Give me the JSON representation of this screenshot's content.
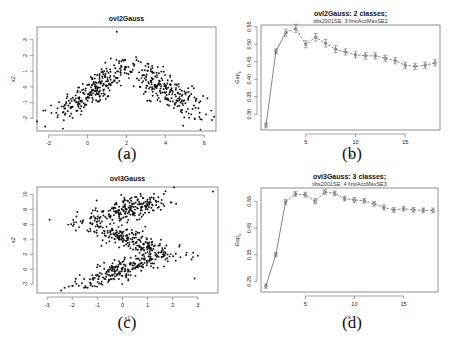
{
  "figure": {
    "captions": [
      "(a)",
      "(b)",
      "(c)",
      "(d)"
    ]
  },
  "chart_data": [
    {
      "id": "a",
      "type": "scatter",
      "title": "ovl2Gauss",
      "xlabel": "x1",
      "ylabel": "x2",
      "xlim": [
        -2.6,
        6.6
      ],
      "ylim": [
        -2.8,
        3.8
      ],
      "xticks": [
        -2,
        0,
        2,
        4,
        6
      ],
      "yticks": [
        -2,
        -1,
        0,
        1,
        2,
        3
      ],
      "grid": false,
      "description": "Two overlapping Gaussian clusters forming an inverted-V arch; left cluster centered near (0,0) rising rightward, right cluster centered near (4,0) falling rightward",
      "clusters": [
        {
          "cx": 0.3,
          "cy": -0.2,
          "sx": 1.0,
          "sy": 0.55,
          "slope": 0.75,
          "n": 250
        },
        {
          "cx": 4.0,
          "cy": -0.2,
          "sx": 1.0,
          "sy": 0.55,
          "slope": -0.75,
          "n": 250
        }
      ],
      "outliers": [
        [
          1.5,
          3.5
        ],
        [
          -2.6,
          -2.2
        ],
        [
          6.5,
          -1.9
        ]
      ]
    },
    {
      "id": "b",
      "type": "line",
      "title": "ovl2Gauss: 2 classes;",
      "subtitle": "tibs2001SE: 3 firstAccMaxSE2",
      "xlabel": "k",
      "ylabel": "Gap_k",
      "xlim": [
        0.5,
        18.5
      ],
      "ylim": [
        0.255,
        0.555
      ],
      "xticks": [
        5,
        10,
        15
      ],
      "yticks": [
        0.3,
        0.35,
        0.4,
        0.45,
        0.5,
        0.55
      ],
      "grid": false,
      "error_bars": true,
      "x": [
        1,
        2,
        3,
        4,
        5,
        6,
        7,
        8,
        9,
        10,
        11,
        12,
        13,
        14,
        15,
        16,
        17,
        18
      ],
      "values": [
        0.268,
        0.48,
        0.533,
        0.545,
        0.5,
        0.52,
        0.503,
        0.486,
        0.478,
        0.47,
        0.467,
        0.467,
        0.46,
        0.453,
        0.44,
        0.437,
        0.44,
        0.447
      ],
      "se": [
        0.007,
        0.007,
        0.01,
        0.012,
        0.01,
        0.011,
        0.011,
        0.01,
        0.009,
        0.009,
        0.009,
        0.009,
        0.009,
        0.009,
        0.009,
        0.009,
        0.009,
        0.009
      ]
    },
    {
      "id": "c",
      "type": "scatter",
      "title": "ovl3Gauss",
      "xlabel": "x1",
      "ylabel": "x2",
      "xlim": [
        -3.4,
        3.8
      ],
      "ylim": [
        -3.2,
        11.0
      ],
      "xticks": [
        -3,
        -2,
        -1,
        0,
        1,
        2,
        3
      ],
      "yticks": [
        -2,
        0,
        2,
        4,
        6,
        8,
        10
      ],
      "grid": false,
      "description": "Three elongated overlapping Gaussian clusters: top band rising near x2=8, middle band falling near x2=4, bottom band rising near x2=0",
      "clusters": [
        {
          "cx": 0.2,
          "cy": 8.0,
          "sx": 0.95,
          "sy": 0.7,
          "slope": 0.8,
          "n": 230
        },
        {
          "cx": 0.3,
          "cy": 3.9,
          "sx": 0.95,
          "sy": 0.7,
          "slope": -1.1,
          "n": 230
        },
        {
          "cx": 0.1,
          "cy": 0.1,
          "sx": 0.95,
          "sy": 0.7,
          "slope": 1.1,
          "n": 230
        }
      ],
      "outliers": [
        [
          3.6,
          10.4
        ],
        [
          3.0,
          1.8
        ],
        [
          -2.9,
          6.6
        ]
      ]
    },
    {
      "id": "d",
      "type": "line",
      "title": "ovl3Gauss: 3 classes;",
      "subtitle": "tibs2001SE: 4 firstAccMaxSE3",
      "xlabel": "k",
      "ylabel": "Gap_k",
      "xlim": [
        0.5,
        18.5
      ],
      "ylim": [
        0.21,
        0.6
      ],
      "xticks": [
        5,
        10,
        15
      ],
      "yticks": [
        0.25,
        0.35,
        0.45,
        0.55
      ],
      "grid": false,
      "error_bars": true,
      "x": [
        1,
        2,
        3,
        4,
        5,
        6,
        7,
        8,
        9,
        10,
        11,
        12,
        13,
        14,
        15,
        16,
        17,
        18
      ],
      "values": [
        0.232,
        0.35,
        0.548,
        0.578,
        0.575,
        0.55,
        0.585,
        0.58,
        0.56,
        0.555,
        0.552,
        0.541,
        0.527,
        0.518,
        0.522,
        0.518,
        0.516,
        0.516
      ],
      "se": [
        0.008,
        0.008,
        0.009,
        0.009,
        0.009,
        0.01,
        0.009,
        0.009,
        0.009,
        0.009,
        0.009,
        0.009,
        0.009,
        0.009,
        0.009,
        0.009,
        0.009,
        0.009
      ]
    }
  ]
}
